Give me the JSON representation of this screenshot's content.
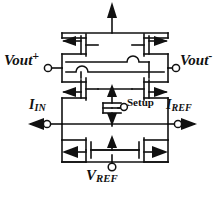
{
  "figure": {
    "type": "circuit-schematic",
    "title_visible": false,
    "background_color": "#ffffff",
    "line_color": "#111111",
    "width": 223,
    "height": 200
  },
  "labels": {
    "vout_plus": {
      "base": "Vout",
      "script": "+",
      "script_type": "superscript"
    },
    "vout_minus": {
      "base": "Vout",
      "script": "-",
      "script_type": "superscript"
    },
    "i_in": {
      "base": "I",
      "script": "IN",
      "script_type": "subscript"
    },
    "i_ref": {
      "base": "I",
      "script": "REF",
      "script_type": "subscript"
    },
    "v_ref": {
      "base": "V",
      "script": "REF",
      "script_type": "subscript"
    },
    "setup": {
      "base": "Setup",
      "script": "",
      "script_type": "none"
    }
  },
  "terminals": [
    {
      "name": "vout-plus-terminal",
      "x": 48,
      "y": 68,
      "kind": "open-circle"
    },
    {
      "name": "vout-minus-terminal",
      "x": 176,
      "y": 68,
      "kind": "open-circle"
    },
    {
      "name": "i-in-terminal",
      "x": 47,
      "y": 124,
      "kind": "open-circle"
    },
    {
      "name": "i-ref-terminal",
      "x": 178,
      "y": 124,
      "kind": "open-circle"
    },
    {
      "name": "setup-terminal",
      "x": 124,
      "y": 107,
      "kind": "open-circle"
    },
    {
      "name": "v-ref-terminal",
      "x": 112,
      "y": 159,
      "kind": "open-circle"
    }
  ],
  "current_arrows": [
    {
      "name": "supply-current-arrow",
      "direction": "up",
      "x": 112,
      "y": 6
    },
    {
      "name": "i-in-arrow",
      "direction": "left",
      "x": 36,
      "y": 124
    },
    {
      "name": "i-ref-arrow",
      "direction": "right",
      "x": 190,
      "y": 124
    },
    {
      "name": "tail-current-arrow-up",
      "direction": "up",
      "x": 112,
      "y": 90
    },
    {
      "name": "tail-current-arrow-down",
      "direction": "down",
      "x": 112,
      "y": 119
    },
    {
      "name": "bottom-current-arrow-up",
      "direction": "up",
      "x": 112,
      "y": 141
    }
  ],
  "transistors": [
    {
      "name": "pmos-top-left",
      "type": "PMOS",
      "x": 72,
      "y": 44
    },
    {
      "name": "pmos-top-right",
      "type": "PMOS",
      "x": 152,
      "y": 44
    },
    {
      "name": "nmos-mid-left",
      "type": "NMOS",
      "x": 72,
      "y": 86
    },
    {
      "name": "nmos-mid-right",
      "type": "NMOS",
      "x": 152,
      "y": 86
    },
    {
      "name": "nmos-setup",
      "type": "NMOS",
      "x": 112,
      "y": 110
    },
    {
      "name": "nmos-bottom-left",
      "type": "NMOS",
      "x": 72,
      "y": 150
    },
    {
      "name": "nmos-bottom-right",
      "type": "NMOS",
      "x": 152,
      "y": 150
    }
  ]
}
